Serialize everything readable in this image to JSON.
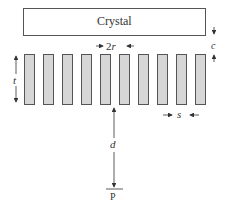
{
  "crystal": {
    "label": "Crystal"
  },
  "dimensions": {
    "diameter_label_prefix": "2",
    "diameter_label_var": "r",
    "thickness_label": "t",
    "gap_label": "c",
    "spacing_label": "s",
    "distance_label": "d",
    "point_label": "P"
  },
  "grid": {
    "bar_count": 10
  },
  "colors": {
    "bar_fill": "#d6d6d6",
    "stroke": "#555555"
  }
}
